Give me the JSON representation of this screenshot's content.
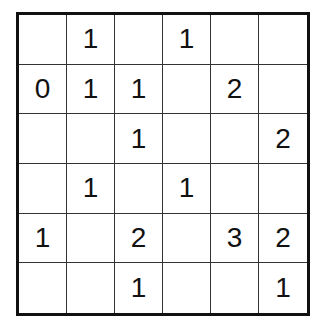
{
  "puzzle": {
    "rows": 6,
    "cols": 6,
    "grid": [
      [
        "",
        "1",
        "",
        "1",
        "",
        ""
      ],
      [
        "0",
        "1",
        "1",
        "",
        "2",
        ""
      ],
      [
        "",
        "",
        "1",
        "",
        "",
        "2"
      ],
      [
        "",
        "1",
        "",
        "1",
        "",
        ""
      ],
      [
        "1",
        "",
        "2",
        "",
        "3",
        "2"
      ],
      [
        "",
        "",
        "1",
        "",
        "",
        "1"
      ]
    ]
  }
}
